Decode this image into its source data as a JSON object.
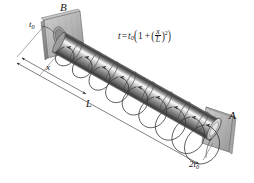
{
  "figure": {
    "background_color": "#ffffff",
    "line_color": "#3c3c3c",
    "plate_color": "#b9b9b9",
    "shaft_light": "#f2f2f2",
    "shaft_mid": "#8d8d8d",
    "shaft_dark": "#4a4a4a"
  },
  "labels": {
    "support_left": "B",
    "support_right": "A",
    "thickness_left": "t",
    "thickness_left_sub": "0",
    "thickness_right_coeff": "2",
    "thickness_right": "t",
    "thickness_right_sub": "0",
    "dim_x": "x",
    "dim_L": "L"
  },
  "equation": {
    "lhs": "t",
    "equals": "=",
    "t0": "t",
    "t0_sub": "0",
    "open_paren": "(",
    "one": "1",
    "plus": "+",
    "inner_open": "(",
    "frac_num": "x",
    "frac_den": "L",
    "inner_close": ")",
    "exponent": "2",
    "close_paren": ")",
    "plain": "t = t0(1 + (x/L)^2)"
  },
  "geometry": {
    "shaft_start": {
      "x": 58,
      "y": 42
    },
    "shaft_end": {
      "x": 216,
      "y": 131
    },
    "segment_count": 8,
    "torque_loop_count": 9
  }
}
